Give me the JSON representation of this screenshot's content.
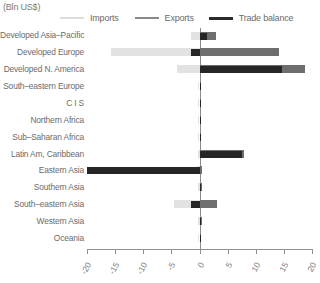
{
  "chart_data": {
    "type": "bar",
    "orientation": "horizontal",
    "title": "(Bln US$)",
    "xlabel": "",
    "ylabel": "",
    "xlim": [
      -20,
      20
    ],
    "xticks": [
      "-20",
      "-15",
      "-10",
      "-5",
      "0",
      "5",
      "10",
      "15",
      "20"
    ],
    "xtick_values": [
      -20,
      -15,
      -10,
      -5,
      0,
      5,
      10,
      15,
      20
    ],
    "grid": false,
    "legend_position": "top",
    "categories": [
      "Developed Asia–Pacific",
      "Developed Europe",
      "Developed N. America",
      "South–eastern Europe",
      "C I S",
      "Northern Africa",
      "Sub–Saharan Africa",
      "Latin Am, Caribbean",
      "Eastern Asia",
      "Southern Asia",
      "South–eastern Asia",
      "Western Asia",
      "Oceania"
    ],
    "series": [
      {
        "name": "Imports",
        "color": "#e2e2e2",
        "values": [
          -1.6,
          -15.8,
          -4.0,
          -0.2,
          -0.2,
          -0.1,
          -0.2,
          -0.3,
          -0.4,
          -0.3,
          -4.6,
          -0.3,
          -0.05
        ]
      },
      {
        "name": "Exports",
        "color": "#6e6e6e",
        "values": [
          2.9,
          14.2,
          18.7,
          0.2,
          0.3,
          0.1,
          0.2,
          7.9,
          0.4,
          0.5,
          3.1,
          0.4,
          0.05
        ]
      },
      {
        "name": "Trade balance",
        "color": "#262626",
        "values": [
          1.3,
          -1.6,
          14.7,
          0.05,
          0.1,
          0.05,
          0.05,
          7.6,
          -20.0,
          0.2,
          -1.5,
          0.1,
          0.02
        ]
      }
    ]
  },
  "legend": {
    "items": [
      {
        "label": "Imports",
        "color": "#dcdcdc"
      },
      {
        "label": "Exports",
        "color": "#8a8a8a"
      },
      {
        "label": "Trade balance",
        "color": "#2b2b2b"
      }
    ]
  }
}
